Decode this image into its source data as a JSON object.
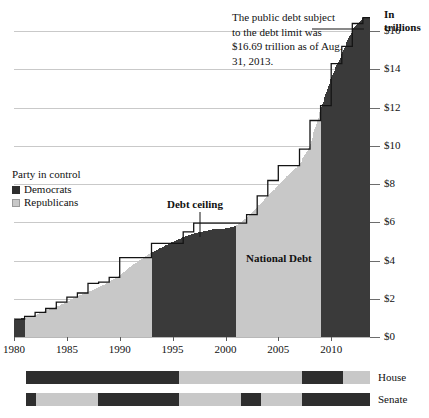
{
  "chart_data": {
    "type": "area",
    "title": "",
    "xlabel": "",
    "ylabel": "In trillions",
    "xlim": [
      1980,
      2013.67
    ],
    "ylim": [
      0,
      17.2
    ],
    "grid": true,
    "legend_position": "left-middle",
    "y_ticks": [
      "$0",
      "$2",
      "$4",
      "$6",
      "$8",
      "$10",
      "$12",
      "$14",
      "$16"
    ],
    "y_tick_values": [
      0,
      2,
      4,
      6,
      8,
      10,
      12,
      14,
      16
    ],
    "x_ticks": [
      "1980",
      "1985",
      "1990",
      "1995",
      "2000",
      "2005",
      "2010"
    ],
    "x_tick_values": [
      1980,
      1985,
      1990,
      1995,
      2000,
      2005,
      2010
    ],
    "series": [
      {
        "name": "National Debt",
        "type": "area",
        "x": [
          1980,
          1981,
          1982,
          1983,
          1984,
          1985,
          1986,
          1987,
          1988,
          1989,
          1990,
          1991,
          1992,
          1993,
          1994,
          1995,
          1996,
          1997,
          1998,
          1999,
          2000,
          2001,
          2002,
          2003,
          2004,
          2005,
          2006,
          2007,
          2008,
          2009,
          2010,
          2011,
          2012,
          2013
        ],
        "values": [
          0.91,
          1.0,
          1.14,
          1.38,
          1.57,
          1.82,
          2.13,
          2.35,
          2.6,
          2.87,
          3.23,
          3.67,
          4.06,
          4.41,
          4.69,
          4.97,
          5.22,
          5.41,
          5.53,
          5.66,
          5.67,
          5.81,
          6.23,
          6.78,
          7.38,
          7.93,
          8.51,
          9.01,
          10.02,
          11.91,
          13.56,
          14.79,
          16.07,
          16.69
        ]
      },
      {
        "name": "Debt ceiling",
        "type": "step",
        "x": [
          1980,
          1981,
          1982,
          1983,
          1984,
          1985,
          1986,
          1987,
          1988,
          1989,
          1990,
          1991,
          1992,
          1993,
          1994,
          1995,
          1996,
          1997,
          1998,
          1999,
          2000,
          2001,
          2002,
          2003,
          2004,
          2005,
          2006,
          2007,
          2008,
          2009,
          2010,
          2011,
          2012,
          2013
        ],
        "values": [
          0.93,
          1.08,
          1.29,
          1.49,
          1.82,
          2.08,
          2.3,
          2.8,
          2.87,
          3.12,
          4.15,
          4.15,
          4.15,
          4.9,
          4.9,
          4.9,
          5.5,
          5.95,
          5.95,
          5.95,
          5.95,
          5.95,
          6.4,
          7.38,
          8.18,
          8.96,
          8.96,
          9.82,
          11.32,
          12.1,
          14.29,
          15.19,
          16.39,
          16.7
        ]
      }
    ],
    "annotations": [
      {
        "name": "callout",
        "text": "The public debt subject to the debt limit was $16.69 trillion as of Aug. 31, 2013."
      },
      {
        "name": "debt-ceiling-label",
        "text": "Debt ceiling"
      },
      {
        "name": "national-debt-label",
        "text": "National Debt"
      }
    ],
    "legend": {
      "title": "Party in control",
      "entries": [
        {
          "label": "Democrats",
          "color": "#2e2e2e"
        },
        {
          "label": "Republicans",
          "color": "#c8c8c8"
        }
      ]
    },
    "control_bars": [
      {
        "name": "House",
        "label": "House",
        "segments": [
          {
            "party": "Democrats",
            "start": 1980,
            "end": 1995
          },
          {
            "party": "Republicans",
            "start": 1995,
            "end": 2007
          },
          {
            "party": "Democrats",
            "start": 2007,
            "end": 2011
          },
          {
            "party": "Republicans",
            "start": 2011,
            "end": 2013.67
          }
        ]
      },
      {
        "name": "Senate",
        "label": "Senate",
        "segments": [
          {
            "party": "Democrats",
            "start": 1980,
            "end": 1981
          },
          {
            "party": "Republicans",
            "start": 1981,
            "end": 1987
          },
          {
            "party": "Democrats",
            "start": 1987,
            "end": 1995
          },
          {
            "party": "Republicans",
            "start": 1995,
            "end": 2001
          },
          {
            "party": "Democrats",
            "start": 2001,
            "end": 2003
          },
          {
            "party": "Republicans",
            "start": 2003,
            "end": 2007
          },
          {
            "party": "Democrats",
            "start": 2007,
            "end": 2013.67
          }
        ]
      }
    ],
    "colors": {
      "democrat": "#2e2e2e",
      "republican": "#c8c8c8",
      "gridline": "#c9c9c9",
      "line": "#141414"
    },
    "president_party_by_year": [
      {
        "start": 1980,
        "end": 1981,
        "party": "Democrats"
      },
      {
        "start": 1981,
        "end": 1993,
        "party": "Republicans"
      },
      {
        "start": 1993,
        "end": 2001,
        "party": "Democrats"
      },
      {
        "start": 2001,
        "end": 2009,
        "party": "Republicans"
      },
      {
        "start": 2009,
        "end": 2013.67,
        "party": "Democrats"
      }
    ]
  },
  "axis": {
    "title_line1": "In",
    "title_line2": "trillions"
  },
  "legend": {
    "title": "Party in control",
    "democrats": "Democrats",
    "republicans": "Republicans"
  },
  "annotations": {
    "callout": "The public debt subject to the debt limit was $16.69 trillion as of Aug. 31, 2013.",
    "debt_ceiling": "Debt ceiling",
    "national_debt": "National Debt"
  },
  "bars": {
    "house_label": "House",
    "senate_label": "Senate"
  }
}
